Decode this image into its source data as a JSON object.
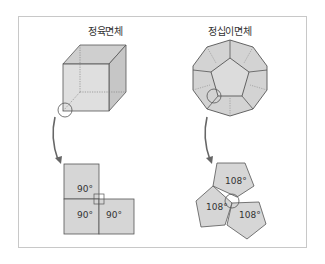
{
  "panels": [
    {
      "title": "정육면체",
      "solid": "cube",
      "net_faces": [
        {
          "shape": "square",
          "angle": "90°"
        },
        {
          "shape": "square",
          "angle": "90°"
        },
        {
          "shape": "square",
          "angle": "90°"
        }
      ]
    },
    {
      "title": "정십이면체",
      "solid": "dodecahedron",
      "net_faces": [
        {
          "shape": "pentagon",
          "angle": "108°"
        },
        {
          "shape": "pentagon",
          "angle": "108°"
        },
        {
          "shape": "pentagon",
          "angle": "108°"
        }
      ]
    }
  ],
  "colors": {
    "face_fill": "#d6d6d6",
    "edge": "#555555",
    "frame": "#c8c8c8"
  }
}
